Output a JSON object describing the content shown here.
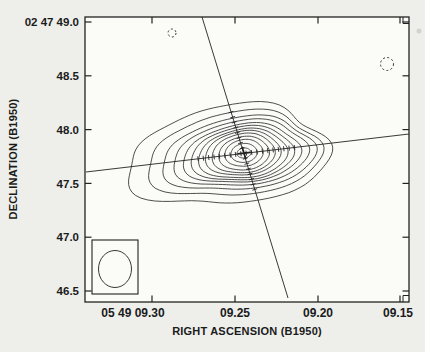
{
  "axes": {
    "x_title": "RIGHT ASCENSION (B1950)",
    "y_title": "DECLINATION (B1950)",
    "x_tick_labels": [
      "05 49 09.30",
      "09.25",
      "09.20",
      "09.15"
    ],
    "y_tick_labels": [
      "02 47 49.0",
      "48.5",
      "48.0",
      "47.5",
      "47.0",
      "46.5"
    ]
  },
  "chart_data": {
    "type": "contour",
    "title": "",
    "xlabel": "RIGHT ASCENSION (B1950)",
    "ylabel": "DECLINATION (B1950)",
    "x_tick_labels": [
      "05 49 09.30",
      "09.25",
      "09.20",
      "09.15"
    ],
    "y_tick_labels": [
      "02 47 49.0",
      "48.5",
      "48.0",
      "47.5",
      "47.0",
      "46.5"
    ],
    "x_axis": {
      "quantity": "Right Ascension (B1950)",
      "prefix": "05 49",
      "units": "seconds of time",
      "range_left_to_right": [
        9.341,
        9.145
      ],
      "note": "RA decreases toward the right"
    },
    "y_axis": {
      "quantity": "Declination (B1950)",
      "prefix": "02 47",
      "units": "arcsec",
      "range_bottom_to_top": [
        46.4,
        49.05
      ]
    },
    "grid": false,
    "legend": false,
    "source": {
      "peak_position": {
        "ra": "05 49 09.244",
        "dec": "02 47 47.79"
      },
      "morphology": "single compact source, nested closed contours elongated E-W with irregular outer envelope extending SW",
      "positive_contour_levels_count": 13,
      "negative_contours": [
        {
          "ra": "05 49 09.288",
          "dec": "02 47 48.90",
          "style": "dashed"
        },
        {
          "ra": "05 49 09.158",
          "dec": "02 47 48.61",
          "style": "dashed"
        }
      ]
    },
    "overlays": {
      "crossing_lines": "two straight lines with small hatch marks intersecting at the source peak (one steep, one shallow)",
      "beam": "clean beam shown as near-circular ellipse (~0.3 arcsec) inside box at bottom-left"
    }
  },
  "style": {
    "page_bg": "#eeefeb",
    "plot_bg": "#fbfbf8",
    "ink": "#222222",
    "text_ink": "#1b1b1b"
  },
  "geometry": {
    "canvas": {
      "w": 425,
      "h": 352
    },
    "plot_box": {
      "x": 85,
      "y": 17,
      "w": 324,
      "h": 285
    },
    "x_ticks_px": [
      152,
      235,
      318,
      400
    ],
    "x_label_centers_px": [
      133,
      235,
      318,
      398
    ],
    "y_ticks_px": [
      22,
      75.8,
      129.6,
      183.4,
      237.2,
      291
    ],
    "tick_len": 6.5,
    "lines": [
      {
        "name": "steep-line",
        "x1": 202,
        "y1": 17,
        "x2": 288,
        "y2": 298,
        "hatch_axis": "y",
        "hatch_from": 112,
        "hatch_to": 193
      },
      {
        "name": "shallow-line",
        "x1": 86,
        "y1": 172,
        "x2": 409,
        "y2": 134,
        "hatch_axis": "x",
        "hatch_from": 198,
        "hatch_to": 295
      }
    ],
    "hatch_spacing": 5.4,
    "hatch_len": 5,
    "center_mark": {
      "x": 244,
      "y": 153,
      "r": 6.5
    },
    "contour_rotation_deg": -7,
    "wobble_harmonics": [
      {
        "f": 2,
        "a": 0.004,
        "p": 1.57
      },
      {
        "f": 3,
        "a": 0.005,
        "p": 5.8
      },
      {
        "f": 5,
        "a": 0.003,
        "p": 1.1
      },
      {
        "f": 7,
        "a": 0.0045,
        "p": 2.0,
        "min_level": 9
      }
    ],
    "contours": [
      {
        "cx": 244,
        "cy": 153,
        "rx": 7,
        "ry": 5,
        "w": 1
      },
      {
        "cx": 244,
        "cy": 153,
        "rx": 13,
        "ry": 9.5,
        "w": 2
      },
      {
        "cx": 244,
        "cy": 153,
        "rx": 19,
        "ry": 13.5,
        "w": 3
      },
      {
        "cx": 244,
        "cy": 153.5,
        "rx": 25,
        "ry": 17,
        "w": 4
      },
      {
        "cx": 243.5,
        "cy": 153.5,
        "rx": 31,
        "ry": 20,
        "w": 5
      },
      {
        "cx": 243,
        "cy": 153.5,
        "rx": 37,
        "ry": 22.5,
        "w": 6
      },
      {
        "cx": 243,
        "cy": 154,
        "rx": 43.5,
        "ry": 25,
        "w": 7
      },
      {
        "cx": 242.5,
        "cy": 154,
        "rx": 50,
        "ry": 27.5,
        "w": 8
      },
      {
        "cx": 242,
        "cy": 154,
        "rx": 57,
        "ry": 30,
        "w": 9
      },
      {
        "cx": 241,
        "cy": 154,
        "rx": 65,
        "ry": 33.5,
        "w": 10
      },
      {
        "cx": 239,
        "cy": 154.5,
        "rx": 73.5,
        "ry": 37.5,
        "w": 11
      },
      {
        "cx": 235,
        "cy": 155,
        "rx": 83,
        "ry": 43.5,
        "w": 12
      },
      {
        "cx": 229,
        "cy": 156,
        "rx": 96,
        "ry": 51.5,
        "w": 13
      }
    ],
    "negative_contours": [
      {
        "cx": 172,
        "cy": 33,
        "r": 4
      },
      {
        "cx": 387,
        "cy": 64,
        "r": 6.5
      }
    ],
    "beam": {
      "box": {
        "x": 92,
        "y": 240,
        "w": 46,
        "h": 54
      },
      "ellipse": {
        "cx": 115,
        "cy": 269,
        "rx": 16.5,
        "ry": 18.5
      }
    },
    "corner_marks": {
      "inset": 6,
      "arm": 6.5
    },
    "artifact": {
      "x": 419,
      "y": 31,
      "r": 2.5
    }
  }
}
